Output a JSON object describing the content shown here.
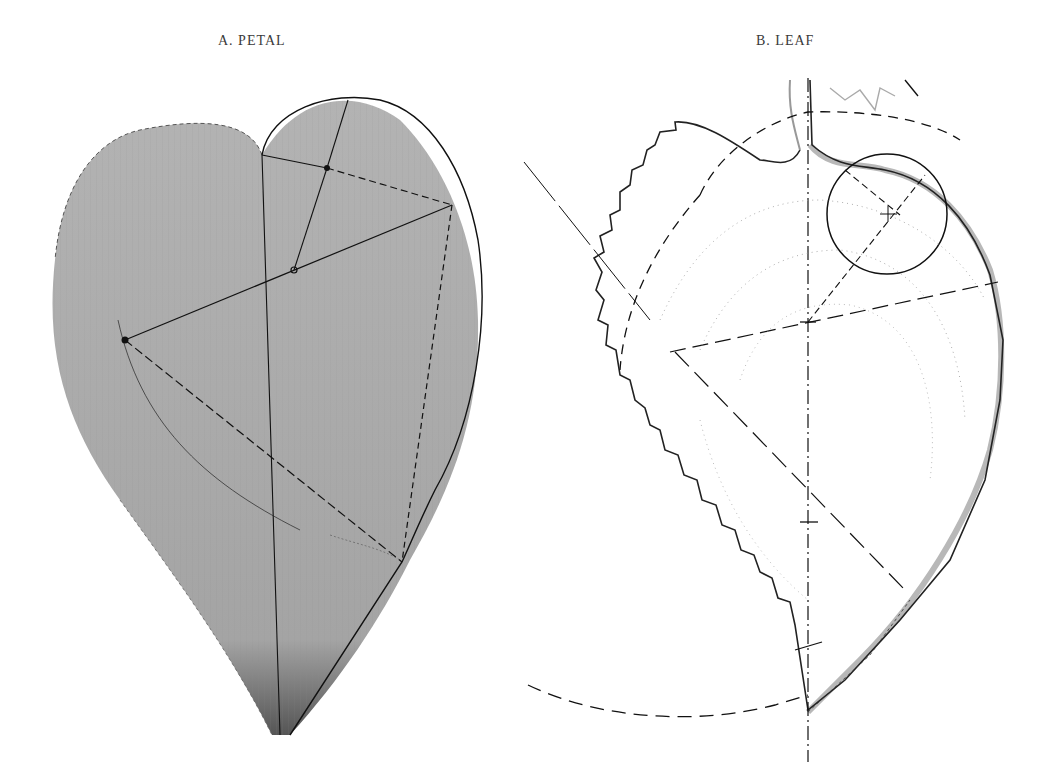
{
  "figure": {
    "panels": [
      {
        "id": "A",
        "label": "A.  PETAL",
        "subject": "petal",
        "fill_color": "#a9a9a9",
        "line_color": "#111111"
      },
      {
        "id": "B",
        "label": "B. LEAF",
        "subject": "leaf",
        "outline_color": "#222222",
        "shadow_color": "#b5b5b5",
        "line_color": "#111111"
      }
    ]
  }
}
